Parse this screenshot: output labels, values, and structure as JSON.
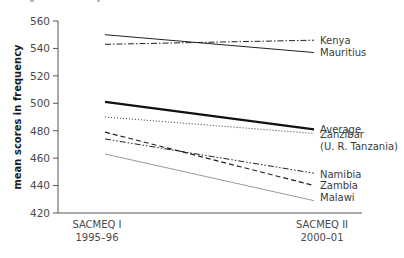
{
  "chart_data": {
    "type": "line",
    "title": "",
    "xlabel": "",
    "ylabel": "mean scores in frequency",
    "ylim": [
      420,
      560
    ],
    "yticks": [
      420,
      440,
      460,
      480,
      500,
      520,
      540,
      560
    ],
    "grid": false,
    "legend": "inline-right",
    "categories": [
      {
        "line1": "SACMEQ I",
        "line2": "1995–96"
      },
      {
        "line1": "SACMEQ II",
        "line2": "2000–01"
      }
    ],
    "series": [
      {
        "name": "Kenya",
        "label_lines": [
          "Kenya"
        ],
        "values": [
          543,
          546
        ],
        "style": "dashdot",
        "color": "#222222",
        "width": 1
      },
      {
        "name": "Mauritius",
        "label_lines": [
          "Mauritius"
        ],
        "values": [
          550,
          537
        ],
        "style": "solid",
        "color": "#222222",
        "width": 1
      },
      {
        "name": "Average",
        "label_lines": [
          "Average"
        ],
        "values": [
          501,
          481
        ],
        "style": "solid",
        "color": "#111111",
        "width": 2.2
      },
      {
        "name": "Zanzibar (U. R. Tanzania)",
        "label_lines": [
          "Zanzibar",
          "(U. R. Tanzania)"
        ],
        "values": [
          490,
          478
        ],
        "style": "dotted",
        "color": "#333333",
        "width": 1
      },
      {
        "name": "Namibia",
        "label_lines": [
          "Namibia"
        ],
        "values": [
          474,
          449
        ],
        "style": "dashdotdot",
        "color": "#222222",
        "width": 1
      },
      {
        "name": "Zambia",
        "label_lines": [
          "Zambia"
        ],
        "values": [
          479,
          440
        ],
        "style": "dashed",
        "color": "#222222",
        "width": 1.2
      },
      {
        "name": "Malawi",
        "label_lines": [
          "Malawi"
        ],
        "values": [
          463,
          429
        ],
        "style": "solid",
        "color": "#9a9a9a",
        "width": 1
      }
    ],
    "label_positions": {
      "Kenya": 546,
      "Mauritius": 537,
      "Average": 481,
      "Zanzibar (U. R. Tanzania)": 477,
      "Namibia": 448,
      "Zambia": 440,
      "Malawi": 431
    }
  }
}
